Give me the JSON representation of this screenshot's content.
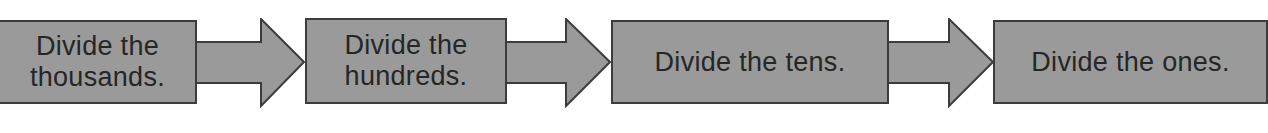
{
  "diagram": {
    "type": "flowchart",
    "direction": "left-to-right",
    "colors": {
      "box_fill": "#9a9a9a",
      "box_border": "#3c3c3c",
      "text": "#262626",
      "background": "#ffffff"
    },
    "steps": [
      {
        "label": "Divide the\nthousands."
      },
      {
        "label": "Divide the\nhundreds."
      },
      {
        "label": "Divide the tens."
      },
      {
        "label": "Divide the ones."
      }
    ],
    "connectors": [
      {
        "from": 0,
        "to": 1,
        "shape": "block-arrow-right"
      },
      {
        "from": 1,
        "to": 2,
        "shape": "block-arrow-right"
      },
      {
        "from": 2,
        "to": 3,
        "shape": "block-arrow-right"
      }
    ]
  }
}
